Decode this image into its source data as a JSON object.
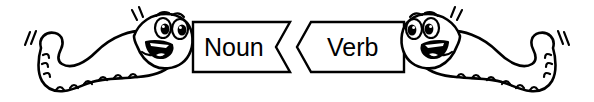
{
  "illustration": {
    "title": "Two cartoon worms holding interlocking Noun and Verb banners",
    "background_color": "#ffffff",
    "ink_color": "#000000",
    "style": "black and white line art clip art"
  },
  "banners": {
    "left": {
      "label": "Noun",
      "name": "noun-banner",
      "fill_color": "#ffffff",
      "border_color": "#000000",
      "edge_shape": "zigzag-notch-right"
    },
    "right": {
      "label": "Verb",
      "name": "verb-banner",
      "fill_color": "#ffffff",
      "border_color": "#000000",
      "edge_shape": "chevron-point-left"
    }
  },
  "characters": [
    {
      "name": "left-worm",
      "facing": "right",
      "expression": "smiling",
      "eyes": 2,
      "has_motion_lines": true
    },
    {
      "name": "right-worm",
      "facing": "left",
      "expression": "smiling",
      "eyes": 2,
      "has_motion_lines": true
    }
  ]
}
